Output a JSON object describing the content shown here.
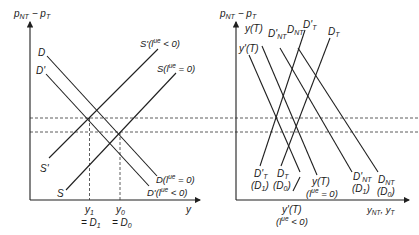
{
  "left_panel": {
    "y_axis_label": "p_NT − p_T",
    "y_axis_label_main": "p",
    "y_axis_label_sub1": "NT",
    "y_axis_label_mid": " − p",
    "y_axis_label_sub2": "T",
    "x_axis_label": "y",
    "curves": {
      "D": "D",
      "D_prime": "D'",
      "S": "S",
      "S_prime": "S'",
      "S_end": "S(l",
      "S_end_sup": "ue",
      "S_end_tail": " = 0)",
      "S_prime_end": "S'(l",
      "S_prime_end_sup": "ue",
      "S_prime_end_tail": " < 0)",
      "D_end": "D(l",
      "D_end_sup": "ue",
      "D_end_tail": " = 0)",
      "D_prime_end": "D'(l",
      "D_prime_end_sup": "ue",
      "D_prime_end_tail": " < 0)"
    },
    "x_ticks": {
      "y1": "y",
      "y1_sub": "1",
      "y1_eq": "= D",
      "y1_eq_sub": "1",
      "y0": "y",
      "y0_sub": "0",
      "y0_eq": "= D",
      "y0_eq_sub": "0"
    }
  },
  "right_panel": {
    "y_axis_label_main": "p",
    "y_axis_label_sub1": "NT",
    "y_axis_label_mid": " − p",
    "y_axis_label_sub2": "T",
    "x_axis_label_a": "y",
    "x_axis_label_a_sub": "NT",
    "x_axis_label_b": ", y",
    "x_axis_label_b_sub": "T",
    "top_labels": {
      "yT": "y(T)",
      "yT_prime": "y'(T)",
      "DNT_prime": "D'",
      "DNT_prime_sub": "NT",
      "DNT": "D",
      "DNT_sub": "NT",
      "DT_prime": "D'",
      "DT_prime_sub": "T",
      "DT": "D",
      "DT_sub": "T"
    },
    "bottom_labels": {
      "DT_prime": "D'",
      "DT_prime_sub": "T",
      "DT_prime_case": "(D",
      "DT_prime_case_sub": "1",
      "DT": "D",
      "DT_sub": "T",
      "DT_case": "(D",
      "DT_case_sub": "0",
      "yT": "y(T)",
      "yT_case": "(l",
      "yT_case_sup": "ue",
      "yT_case_tail": " = 0)",
      "yT_prime": "y'(T)",
      "yT_prime_case": "(l",
      "yT_prime_case_sup": "ue",
      "yT_prime_case_tail": " < 0)",
      "DNT_prime": "D'",
      "DNT_prime_sub": "NT",
      "DNT_prime_case": "(D",
      "DNT_prime_case_sub": "1",
      "DNT": "D",
      "DNT_sub": "NT",
      "DNT_case": "(D",
      "DNT_case_sub": "0"
    },
    "close_paren": ")"
  }
}
